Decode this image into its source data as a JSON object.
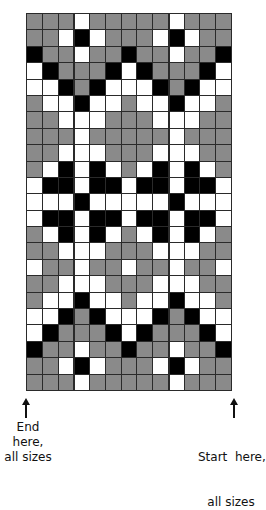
{
  "chart": {
    "title": "",
    "rows": 23,
    "cols": 13,
    "legend": {
      "G": "gray",
      "W": "white",
      "B": "black"
    },
    "colors": {
      "G": "#8a8a8a",
      "W": "#ffffff",
      "B": "#000000",
      "grid_line": "#2a2a2a"
    },
    "pattern": [
      "GGGWGGGGGWGGG",
      "GGWBWGGGWBWGG",
      "BGGWGGBGGWGGB",
      "WBGGGBWBGGGBW",
      "WWBGBWWWBGBWW",
      "GWWBWWGWWBWWG",
      "GGWWWGGGWWWGG",
      "GGGWGGGGGWGGG",
      "GGWWWGGGWWWGG",
      "GWBWBWGWBWBWG",
      "WBBWBBWBBWBBW",
      "WWWBWWWWWBWWW",
      "WBBWBBWBBWBBW",
      "GWBWBWGWBWBWG",
      "GGWWWGGGWWWGG",
      "WGGWGGWGGWGGW",
      "GGWWWGGGWWWGG",
      "GWWBWWGWWBWWG",
      "WWBGBWWWBGBWW",
      "WBGGGBWBGGGBW",
      "BGGWGGBGGWGGB",
      "GGWBWGGGWBWGG",
      "GGGWGGGGGWGGG"
    ],
    "repeat_dividers_after_cols": [
      3,
      9
    ]
  },
  "labels": {
    "end": {
      "line1": "End here,",
      "line2": "all sizes",
      "icon": "arrow-up-icon"
    },
    "start": {
      "line1": "Start  here,",
      "line2": "all sizes",
      "icon": "arrow-up-icon"
    }
  }
}
